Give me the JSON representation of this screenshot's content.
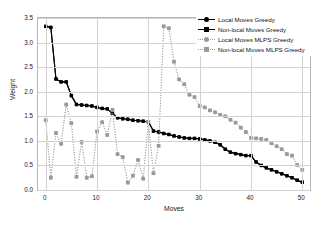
{
  "chart_data": {
    "type": "line",
    "title": "",
    "xlabel": "Moves",
    "ylabel": "Weight",
    "xlim": [
      -1.5,
      51.5
    ],
    "ylim": [
      0.0,
      3.5
    ],
    "xticks": [
      0,
      10,
      20,
      30,
      40,
      50
    ],
    "yticks": [
      "0.0",
      "0.5",
      "1.0",
      "1.5",
      "2.0",
      "2.5",
      "3.0",
      "3.5"
    ],
    "grid": true,
    "legend_position": "top-right",
    "series": [
      {
        "name": "Local Moves Greedy",
        "color": "#000000",
        "marker": "circle",
        "linestyle": "solid",
        "x": [
          0,
          1,
          2,
          3,
          4,
          5,
          6,
          7,
          8,
          9,
          10,
          11,
          12,
          13,
          14,
          15,
          16,
          17,
          18,
          19,
          20,
          21,
          22,
          23,
          24,
          25,
          26,
          27,
          28,
          29,
          30,
          31,
          32,
          33,
          34,
          35,
          36,
          37,
          38,
          39,
          40,
          41,
          42,
          43,
          44,
          45,
          46,
          47,
          48,
          49,
          50
        ],
        "values": [
          3.33,
          3.31,
          2.26,
          2.2,
          2.2,
          1.92,
          1.74,
          1.73,
          1.72,
          1.71,
          1.68,
          1.66,
          1.65,
          1.56,
          1.47,
          1.45,
          1.44,
          1.42,
          1.41,
          1.4,
          1.39,
          1.2,
          1.18,
          1.15,
          1.13,
          1.1,
          1.08,
          1.06,
          1.05,
          1.05,
          1.04,
          1.02,
          1.0,
          0.97,
          0.92,
          0.83,
          0.77,
          0.74,
          0.72,
          0.7,
          0.7,
          0.57,
          0.5,
          0.45,
          0.41,
          0.37,
          0.33,
          0.29,
          0.25,
          0.2,
          0.16
        ]
      },
      {
        "name": "Non-local Moves Greedy",
        "color": "#000000",
        "marker": "square",
        "linestyle": "solid",
        "x": [
          0,
          1,
          2,
          3,
          4,
          5,
          6,
          7,
          8,
          9,
          10,
          11,
          12,
          13,
          14,
          15,
          16,
          17,
          18,
          19,
          20,
          21,
          22,
          23,
          24,
          25,
          26,
          27,
          28,
          29,
          30,
          31,
          32,
          33,
          34,
          35,
          36,
          37,
          38,
          39,
          40,
          41,
          42,
          43,
          44,
          45,
          46,
          47,
          48,
          49,
          50
        ],
        "values": [
          3.33,
          3.31,
          2.26,
          2.2,
          2.2,
          1.92,
          1.74,
          1.73,
          1.72,
          1.71,
          1.68,
          1.66,
          1.65,
          1.56,
          1.47,
          1.45,
          1.44,
          1.42,
          1.41,
          1.4,
          1.39,
          1.2,
          1.18,
          1.15,
          1.13,
          1.1,
          1.08,
          1.06,
          1.05,
          1.05,
          1.04,
          1.02,
          1.0,
          0.97,
          0.92,
          0.83,
          0.77,
          0.74,
          0.72,
          0.7,
          0.7,
          0.57,
          0.5,
          0.45,
          0.41,
          0.37,
          0.33,
          0.29,
          0.25,
          0.2,
          0.16
        ]
      },
      {
        "name": "Local Moves MLPS Greedy",
        "color": "#9a9a9a",
        "marker": "circle",
        "linestyle": "dotted",
        "x": [
          0,
          1,
          2,
          3,
          4,
          5,
          6,
          7,
          8,
          9,
          10,
          11,
          12,
          13,
          14,
          15,
          16,
          17,
          18,
          19,
          20,
          21,
          22,
          23,
          24,
          25,
          26,
          27,
          28,
          29,
          30,
          31,
          32,
          33,
          34,
          35,
          36,
          37,
          38,
          39,
          40,
          41,
          42,
          43,
          44,
          45,
          46,
          47,
          48,
          49,
          50
        ],
        "values": [
          1.42,
          0.25,
          1.16,
          0.94,
          1.74,
          1.36,
          0.27,
          0.98,
          0.25,
          0.28,
          1.19,
          1.38,
          1.12,
          1.63,
          0.73,
          0.67,
          0.15,
          0.29,
          0.61,
          0.23,
          1.39,
          0.34,
          0.9,
          3.33,
          3.29,
          2.61,
          2.25,
          2.15,
          1.94,
          1.89,
          1.71,
          1.68,
          1.62,
          1.58,
          1.53,
          1.5,
          1.43,
          1.37,
          1.27,
          1.18,
          1.06,
          1.05,
          1.04,
          1.02,
          0.95,
          0.89,
          0.83,
          0.73,
          0.7,
          0.51,
          0.41
        ]
      },
      {
        "name": "Non-local Moves MLPS Greedy",
        "color": "#9a9a9a",
        "marker": "square",
        "linestyle": "dotted",
        "x": [
          0,
          1,
          2,
          3,
          4,
          5,
          6,
          7,
          8,
          9,
          10,
          11,
          12,
          13,
          14,
          15,
          16,
          17,
          18,
          19,
          20,
          21,
          22,
          23,
          24,
          25,
          26,
          27,
          28,
          29,
          30,
          31,
          32,
          33,
          34,
          35,
          36,
          37,
          38,
          39,
          40,
          41,
          42,
          43,
          44,
          45,
          46,
          47,
          48,
          49,
          50
        ],
        "values": [
          1.42,
          0.25,
          1.16,
          0.94,
          1.74,
          1.36,
          0.27,
          0.98,
          0.25,
          0.28,
          1.19,
          1.38,
          1.12,
          1.63,
          0.73,
          0.67,
          0.15,
          0.29,
          0.61,
          0.23,
          1.39,
          0.34,
          0.9,
          3.33,
          3.29,
          2.61,
          2.25,
          2.15,
          1.94,
          1.89,
          1.71,
          1.68,
          1.62,
          1.58,
          1.53,
          1.5,
          1.43,
          1.37,
          1.27,
          1.18,
          1.06,
          1.05,
          1.04,
          1.02,
          0.95,
          0.89,
          0.83,
          0.73,
          0.7,
          0.51,
          0.41
        ]
      }
    ]
  },
  "legend": {
    "items": [
      {
        "label": "Local Moves Greedy"
      },
      {
        "label": "Non-local Moves Greedy"
      },
      {
        "label": "Local Moves MLPS Greedy"
      },
      {
        "label": "Non-local Moves MLPS Greedy"
      }
    ]
  }
}
